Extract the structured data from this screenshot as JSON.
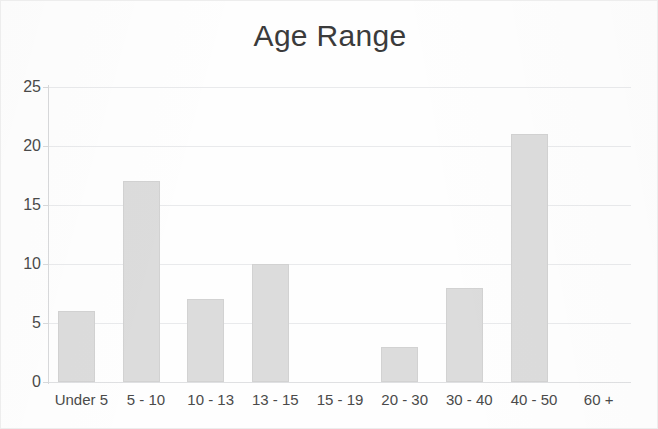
{
  "chart_data": {
    "type": "bar",
    "title": "Age Range",
    "xlabel": "",
    "ylabel": "",
    "categories": [
      "Under 5",
      "5 - 10",
      "10 - 13",
      "13 - 15",
      "15 - 19",
      "20 - 30",
      "30 - 40",
      "40 - 50",
      "60 +"
    ],
    "values": [
      6,
      17,
      7,
      10,
      0,
      3,
      8,
      21,
      0
    ],
    "ylim": [
      0,
      25
    ],
    "y_ticks": [
      0,
      5,
      10,
      15,
      20,
      25
    ],
    "y_tick_labels": [
      "0",
      "5",
      "10",
      "15",
      "20",
      "25"
    ],
    "grid": true,
    "legend": false,
    "bar_color": "#dcdcdc",
    "axis_color": "#d8d9db",
    "gridline_color": "#e9eaec",
    "text_color": "#4a4a4a",
    "title_color": "#3b3b3b",
    "background": "#fefefe"
  }
}
